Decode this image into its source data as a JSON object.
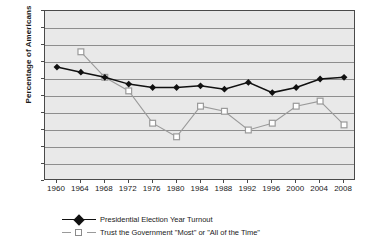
{
  "chart_data": {
    "type": "line",
    "title": "",
    "xlabel": "",
    "ylabel": "Percentage of Americans",
    "ylim": [
      0,
      100
    ],
    "ytick_step": 10,
    "grid": true,
    "legend_position": "bottom-left",
    "categories": [
      1960,
      1964,
      1968,
      1972,
      1976,
      1980,
      1984,
      1988,
      1992,
      1996,
      2000,
      2004,
      2008
    ],
    "xticks": [
      "1960",
      "1964",
      "1968",
      "1972",
      "1976",
      "1980",
      "1984",
      "1988",
      "1992",
      "1996",
      "2000",
      "2004",
      "2008"
    ],
    "yticks": [
      "0",
      "10",
      "20",
      "30",
      "40",
      "50",
      "60",
      "70",
      "80",
      "90",
      "100"
    ],
    "series": [
      {
        "name": "Presidential Election Year Turnout",
        "marker": "filled-diamond",
        "color": "#111111",
        "values": [
          67,
          64,
          61,
          57,
          55,
          55,
          56,
          54,
          58,
          52,
          55,
          60,
          61
        ]
      },
      {
        "name": "Trust the Government \"Most\" or \"All of the Time\"",
        "marker": "open-square",
        "color": "#9a9a9a",
        "values": [
          null,
          76,
          61,
          53,
          34,
          26,
          44,
          41,
          30,
          34,
          44,
          47,
          33
        ]
      }
    ]
  },
  "legend": {
    "items": [
      {
        "label": "Presidential Election Year Turnout",
        "key": "filled-diamond-key"
      },
      {
        "label": "Trust the Government \"Most\" or \"All of the Time\"",
        "key": "open-square-key"
      }
    ]
  },
  "colors": {
    "plot_background": "#e9e9e9",
    "frame": "#4a4a4a",
    "gridline": "#8e8e8e",
    "turnout": "#111111",
    "trust": "#9a9a9a",
    "text": "#1a1a1a"
  }
}
